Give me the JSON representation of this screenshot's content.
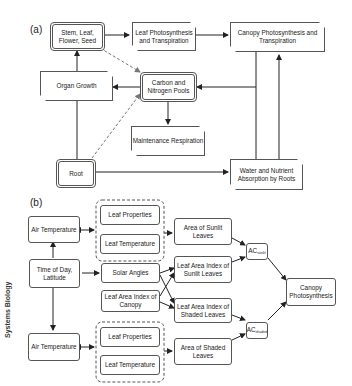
{
  "panel_a": {
    "label": "(a)",
    "nodes": {
      "stem_leaf": "Stem, Leaf, Flower, Seed",
      "leaf_photo": "Leaf Photosynthesis and Transpiration",
      "canopy_photo": "Canopy Photosynthesis and Transpiration",
      "organ_growth": "Organ Growth",
      "carbon_pools": "Carbon and Nitrogen Pools",
      "maintenance": "Maintenance Respiration",
      "root": "Root",
      "water_abs": "Water and Nutrient Absorption by Roots"
    }
  },
  "panel_b": {
    "label": "(b)",
    "nodes": {
      "air_temp_top": "Air Temperature",
      "leaf_props_top": "Leaf Properties",
      "leaf_temp_top": "Leaf Temperature",
      "area_sunlit": "Area of Sunlit Leaves",
      "time_of_day": "Time of Day, Latitude",
      "solar_angles": "Solar Angles",
      "lai_sunlit": "Leaf Area Index of Sunlit Leaves",
      "lai_canopy": "Leaf Area Index of Canopy",
      "lai_shaded": "Leaf Area Index of Shaded Leaves",
      "ac_sunlit_main": "AC",
      "ac_sunlit_sub": "sunlit",
      "ac_shaded_main": "AC",
      "ac_shaded_sub": "shaded",
      "canopy_photosynthesis": "Canopy Photosynthesis",
      "air_temp_bottom": "Air Temperature",
      "leaf_props_bottom": "Leaf Properties",
      "leaf_temp_bottom": "Leaf Temperature",
      "area_shaded": "Area of Shaded Leaves"
    }
  },
  "side_label": "Systems Biology"
}
